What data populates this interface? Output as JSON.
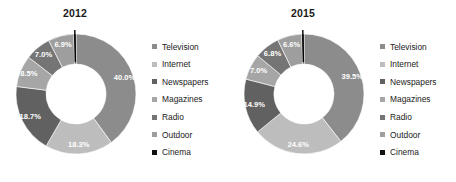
{
  "figure": {
    "clipped_top_text": "",
    "background": "#ffffff"
  },
  "palette": {
    "television": "#8c8c8c",
    "internet": "#bdbdbd",
    "newspapers": "#616161",
    "magazines": "#a6a6a6",
    "radio": "#757575",
    "outdoor": "#9e9e9e",
    "cinema": "#111111"
  },
  "legend": {
    "items": [
      {
        "label": "Television",
        "color": "#8c8c8c"
      },
      {
        "label": "Internet",
        "color": "#bdbdbd"
      },
      {
        "label": "Newspapers",
        "color": "#616161"
      },
      {
        "label": "Magazines",
        "color": "#a6a6a6"
      },
      {
        "label": "Radio",
        "color": "#757575"
      },
      {
        "label": "Outdoor",
        "color": "#9e9e9e"
      },
      {
        "label": "Cinema",
        "color": "#111111"
      }
    ]
  },
  "panels": [
    {
      "title": "2012"
    },
    {
      "title": "2015"
    }
  ],
  "chart_data": [
    {
      "type": "pie",
      "variant": "donut",
      "title": "2012",
      "categories": [
        "Television",
        "Internet",
        "Newspapers",
        "Magazines",
        "Radio",
        "Outdoor",
        "Cinema"
      ],
      "values": [
        40.0,
        18.3,
        18.7,
        8.5,
        7.0,
        6.9,
        0.6
      ],
      "labels": [
        "40.0%",
        "18.3%",
        "18.7%",
        "8.5%",
        "7.0%",
        "6.9%",
        "0.6%"
      ],
      "colors": [
        "#8c8c8c",
        "#bdbdbd",
        "#616161",
        "#a6a6a6",
        "#757575",
        "#9e9e9e",
        "#111111"
      ],
      "units": "percent",
      "start_angle_deg": 0,
      "direction": "clockwise",
      "legend_position": "right",
      "grid": false
    },
    {
      "type": "pie",
      "variant": "donut",
      "title": "2015",
      "categories": [
        "Television",
        "Internet",
        "Newspapers",
        "Magazines",
        "Radio",
        "Outdoor",
        "Cinema"
      ],
      "values": [
        39.5,
        24.6,
        14.9,
        7.0,
        6.8,
        6.6,
        0.6
      ],
      "labels": [
        "39.5%",
        "24.6%",
        "14.9%",
        "7.0%",
        "6.8%",
        "6.6%",
        "0.6%"
      ],
      "colors": [
        "#8c8c8c",
        "#bdbdbd",
        "#616161",
        "#a6a6a6",
        "#757575",
        "#9e9e9e",
        "#111111"
      ],
      "units": "percent",
      "start_angle_deg": 0,
      "direction": "clockwise",
      "legend_position": "right",
      "grid": false
    }
  ]
}
